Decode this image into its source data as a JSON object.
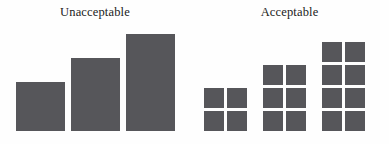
{
  "figure": {
    "background_color": "#fefefe",
    "mark_color": "#56565a",
    "text_color": "#1a1a1a"
  },
  "panels": {
    "unacceptable": {
      "title": "Unacceptable"
    },
    "acceptable": {
      "title": "Acceptable"
    }
  },
  "chart_data": [
    {
      "type": "bar",
      "title": "Unacceptable",
      "categories": [
        "1",
        "2",
        "3"
      ],
      "values": [
        4,
        6,
        8
      ],
      "xlabel": "",
      "ylabel": "",
      "ylim": [
        0,
        8
      ],
      "grid": false,
      "legend": "none",
      "axis_labels_shown": false,
      "tick_labels_shown": false,
      "bar_color": "#56565a",
      "notes": "Three solid vertical bars of increasing height sharing a common baseline; no axes, ticks, or value labels are drawn."
    },
    {
      "type": "bar",
      "title": "Acceptable",
      "categories": [
        "1",
        "2",
        "3"
      ],
      "values": [
        4,
        6,
        8
      ],
      "xlabel": "",
      "ylabel": "",
      "ylim": [
        0,
        8
      ],
      "grid": false,
      "legend": "none",
      "axis_labels_shown": false,
      "tick_labels_shown": false,
      "bar_color": "#56565a",
      "unit_chart": true,
      "units_per_row": 2,
      "unit_rows": [
        2,
        3,
        4
      ],
      "notes": "Same values rendered as unit/waffle squares stacked two per row, so each discrete square equals one unit; groups share a common baseline."
    }
  ],
  "waffle_cells": {
    "group1": [
      [
        "cell",
        "cell"
      ],
      [
        "cell",
        "cell"
      ]
    ],
    "group2": [
      [
        "cell",
        "cell"
      ],
      [
        "cell",
        "cell"
      ],
      [
        "cell",
        "cell"
      ]
    ],
    "group3": [
      [
        "cell",
        "cell"
      ],
      [
        "cell",
        "cell"
      ],
      [
        "cell",
        "cell"
      ],
      [
        "cell",
        "cell"
      ]
    ]
  }
}
